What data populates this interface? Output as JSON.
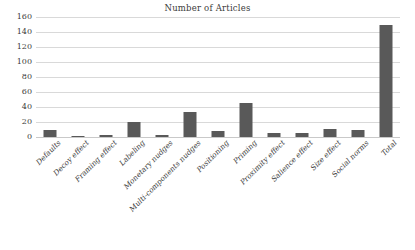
{
  "chart_data": {
    "type": "bar",
    "title": "Number of Articles",
    "xlabel": "",
    "ylabel": "",
    "ylim": [
      0,
      160
    ],
    "yticks": [
      0,
      20,
      40,
      60,
      80,
      100,
      120,
      140,
      160
    ],
    "grid": true,
    "legend": false,
    "bar_color": "#595959",
    "gridline_color": "#d9d9d9",
    "categories": [
      "Defaults",
      "Decoy effect",
      "Framing effect",
      "Labeling",
      "Monetary nudges",
      "Multi-components nudges",
      "Positioning",
      "Priming",
      "Proximity effect",
      "Salience effect",
      "Size effect",
      "Social norms",
      "Total"
    ],
    "values": [
      10,
      2,
      3,
      20,
      3,
      34,
      8,
      46,
      6,
      6,
      11,
      10,
      150
    ]
  }
}
